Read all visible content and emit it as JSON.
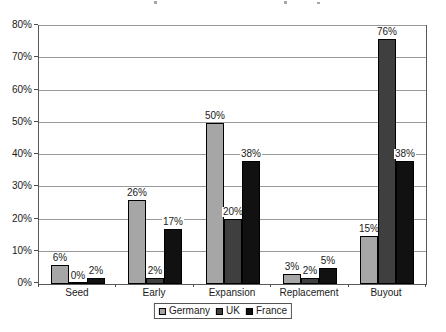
{
  "chart_data": {
    "type": "bar",
    "categories": [
      "Seed",
      "Early",
      "Expansion",
      "Replacement",
      "Buyout"
    ],
    "series": [
      {
        "name": "Germany",
        "color": "#A6A6A6",
        "values": [
          6,
          26,
          50,
          3,
          15
        ]
      },
      {
        "name": "UK",
        "color": "#3F3F3F",
        "values": [
          0,
          2,
          20,
          2,
          76
        ]
      },
      {
        "name": "France",
        "color": "#111111",
        "values": [
          2,
          17,
          38,
          5,
          38
        ]
      }
    ],
    "value_suffix": "%",
    "ylim": [
      0,
      80
    ],
    "ytick_step": 10,
    "ytick_labels": [
      "0%",
      "10%",
      "20%",
      "30%",
      "40%",
      "50%",
      "60%",
      "70%",
      "80%"
    ],
    "grid": true,
    "data_labels_shown": true,
    "legend_position": "bottom",
    "colors": {
      "gridline": "#999999",
      "frame": "#595959",
      "text": "#1a1a1a",
      "label_background": "#ffffff"
    }
  }
}
